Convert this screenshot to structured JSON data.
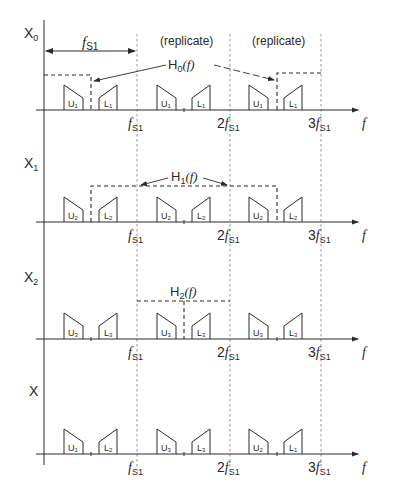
{
  "diagram": {
    "title": "",
    "axis_label_f": "f",
    "vertical_lines": [
      {
        "label_prefix": "",
        "label_main": "f",
        "label_sub": "S1"
      },
      {
        "label_prefix": "2",
        "label_main": "f",
        "label_sub": "S1"
      },
      {
        "label_prefix": "3",
        "label_main": "f",
        "label_sub": "S1"
      }
    ],
    "top_annotations": {
      "span_label_main": "f",
      "span_label_sub": "S1",
      "replicate_1": "(replicate)",
      "replicate_2": "(replicate)"
    },
    "rows": [
      {
        "signal_main": "X",
        "signal_sub": "0",
        "filter_main": "H",
        "filter_sub": "0",
        "filter_arg": "(f)",
        "blocks": [
          {
            "type": "U",
            "sub": "1"
          },
          {
            "type": "L",
            "sub": "1"
          },
          {
            "type": "U",
            "sub": "1"
          },
          {
            "type": "L",
            "sub": "1"
          },
          {
            "type": "U",
            "sub": "1"
          },
          {
            "type": "L",
            "sub": "1"
          }
        ]
      },
      {
        "signal_main": "X",
        "signal_sub": "1",
        "filter_main": "H",
        "filter_sub": "1",
        "filter_arg": "(f)",
        "blocks": [
          {
            "type": "U",
            "sub": "2"
          },
          {
            "type": "L",
            "sub": "2"
          },
          {
            "type": "U",
            "sub": "2"
          },
          {
            "type": "L",
            "sub": "2"
          },
          {
            "type": "U",
            "sub": "2"
          },
          {
            "type": "L",
            "sub": "2"
          }
        ]
      },
      {
        "signal_main": "X",
        "signal_sub": "2",
        "filter_main": "H",
        "filter_sub": "2",
        "filter_arg": "(f)",
        "blocks": [
          {
            "type": "U",
            "sub": "3"
          },
          {
            "type": "L",
            "sub": "3"
          },
          {
            "type": "U",
            "sub": "3"
          },
          {
            "type": "L",
            "sub": "3"
          },
          {
            "type": "U",
            "sub": "3"
          },
          {
            "type": "L",
            "sub": "3"
          }
        ]
      },
      {
        "signal_main": "X",
        "signal_sub": "",
        "blocks": [
          {
            "type": "U",
            "sub": "1"
          },
          {
            "type": "L",
            "sub": "2"
          },
          {
            "type": "U",
            "sub": "3"
          },
          {
            "type": "L",
            "sub": "3"
          },
          {
            "type": "U",
            "sub": "2"
          },
          {
            "type": "L",
            "sub": "1"
          }
        ]
      }
    ],
    "colors": {
      "line": "#2a2a2a",
      "dotted": "#888888",
      "background": "#ffffff"
    }
  }
}
